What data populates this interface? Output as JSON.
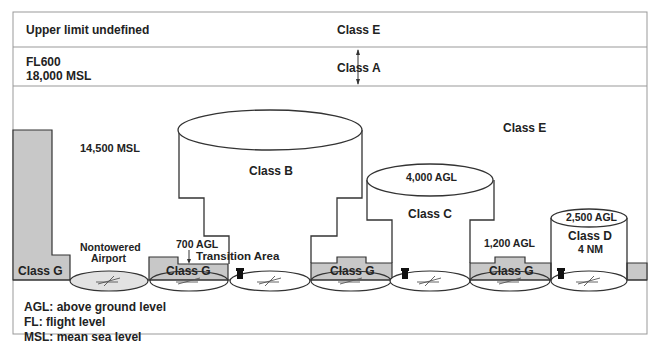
{
  "bands": {
    "upper": {
      "left": "Upper limit undefined",
      "center": "Class E"
    },
    "class_a": {
      "left_line1": "FL600",
      "left_line2": "18,000 MSL",
      "center": "Class A"
    }
  },
  "main": {
    "msl_label": "14,500 MSL",
    "class_e": "Class E",
    "class_b": "Class B",
    "class_c": {
      "label": "Class C",
      "ceiling": "4,000 AGL"
    },
    "class_d": {
      "label": "Class D",
      "radius": "4 NM",
      "ceiling": "2,500 AGL"
    },
    "class_g_labels": [
      "Class G",
      "Class G",
      "Class G",
      "Class G"
    ],
    "nontowered_line1": "Nontowered",
    "nontowered_line2": "Airport",
    "agl_700": "700 AGL",
    "transition_area": "Transition Area",
    "agl_1200": "1,200 AGL"
  },
  "legend": {
    "items": [
      "AGL: above ground level",
      "FL: flight level",
      "MSL: mean sea level"
    ]
  },
  "colors": {
    "shade": "#c8c8c8",
    "line": "#333333",
    "frame": "#888888"
  }
}
